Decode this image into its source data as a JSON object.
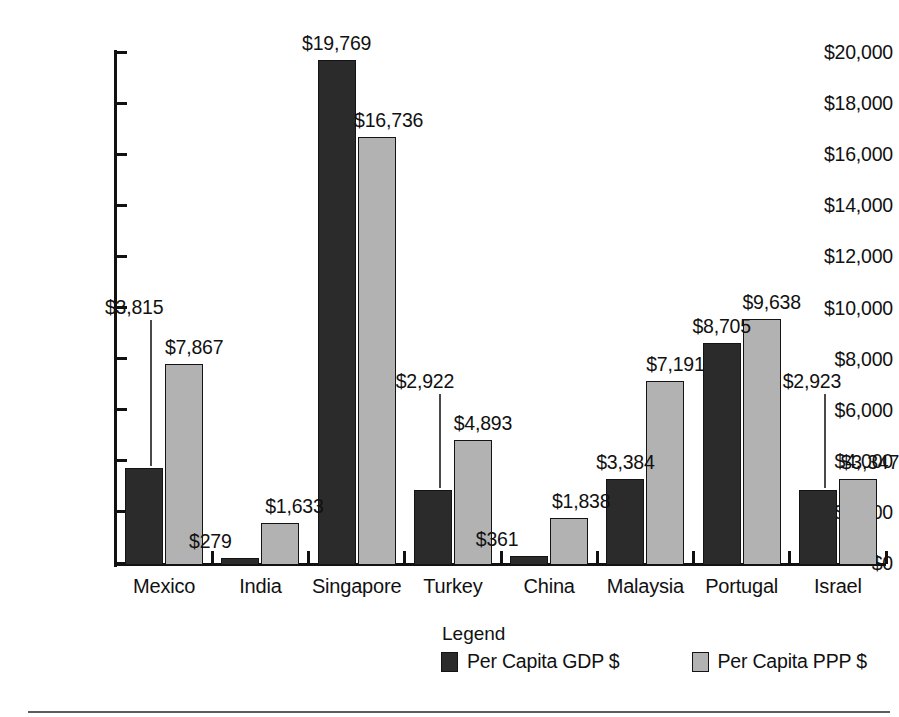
{
  "chart_data": {
    "type": "bar",
    "title": "",
    "subtitle": "",
    "xlabel": "",
    "ylabel": "",
    "grid": false,
    "legend_position": "bottom",
    "legend_title": "Legend",
    "ylim": [
      0,
      20000
    ],
    "ytick_labels": [
      "$20,000",
      "$18,000",
      "$16,000",
      "$14,000",
      "$12,000",
      "$10,000",
      "$8,000",
      "$6,000",
      "$4,000",
      "$2,000",
      "$0"
    ],
    "ytick_values": [
      20000,
      18000,
      16000,
      14000,
      12000,
      10000,
      8000,
      6000,
      4000,
      2000,
      0
    ],
    "categories": [
      "Mexico",
      "India",
      "Singapore",
      "Turkey",
      "China",
      "Malaysia",
      "Portugal",
      "Israel"
    ],
    "series": [
      {
        "name": "Per Capita GDP $",
        "color": "#2b2b2b",
        "values": [
          3815,
          279,
          19769,
          2922,
          361,
          3384,
          8705,
          2923
        ],
        "labels": [
          "$3,815",
          "$279",
          "$19,769",
          "$2,922",
          "$361",
          "$3,384",
          "$8,705",
          "$2,923"
        ]
      },
      {
        "name": "Per Capita PPP $",
        "color": "#b2b2b2",
        "values": [
          7867,
          1633,
          16736,
          4893,
          1838,
          7191,
          9638,
          3347
        ],
        "labels": [
          "$7,867",
          "$1,633",
          "$16,736",
          "$4,893",
          "$1,838",
          "$7,191",
          "$9,638",
          "$3,347"
        ]
      }
    ]
  }
}
